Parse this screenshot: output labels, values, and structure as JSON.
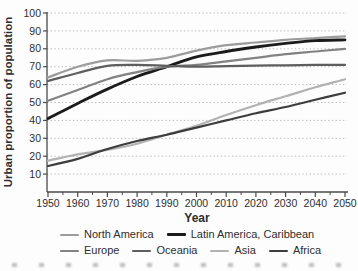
{
  "figure": {
    "background": "#fdfdfd"
  },
  "chart_data": {
    "type": "line",
    "title": "",
    "xlabel": "Year",
    "ylabel": "Urban proportion of population",
    "xlim": [
      1950,
      2050
    ],
    "ylim": [
      0,
      100
    ],
    "grid": "horizontal dotted at every 10 units",
    "legend_position": "below",
    "x": [
      1950,
      1960,
      1970,
      1980,
      1990,
      2000,
      2010,
      2020,
      2030,
      2040,
      2050
    ],
    "x_tick_labels": [
      "1950",
      "1960",
      "1970",
      "1980",
      "1990",
      "2000",
      "2010",
      "2020",
      "2030",
      "2040",
      "2050"
    ],
    "x_minor_ticks": [
      1955,
      1965,
      1975,
      1985,
      1995,
      2005,
      2015,
      2025,
      2035,
      2045
    ],
    "y_ticks": [
      10,
      20,
      30,
      40,
      50,
      60,
      70,
      80,
      90,
      100
    ],
    "y_tick_labels": [
      "10",
      "20",
      "30",
      "40",
      "50",
      "60",
      "70",
      "80",
      "90",
      "100"
    ],
    "series": [
      {
        "name": "North America",
        "color": "#9c9c9c",
        "width": 2.2,
        "values": [
          64,
          70,
          73.5,
          73.3,
          75,
          79,
          82,
          83.5,
          85,
          86,
          87
        ]
      },
      {
        "name": "Latin America, Caribbean",
        "color": "#1b1b1b",
        "width": 2.8,
        "values": [
          41,
          49.5,
          57.5,
          64.5,
          70,
          75.5,
          78.5,
          81,
          83,
          84.5,
          85
        ]
      },
      {
        "name": "Europe",
        "color": "#828282",
        "width": 2.2,
        "values": [
          51,
          57,
          63,
          67,
          70,
          71,
          73,
          75,
          77,
          78.5,
          80
        ]
      },
      {
        "name": "Oceania",
        "color": "#5e5e5e",
        "width": 2.2,
        "values": [
          62,
          66.5,
          70.5,
          71,
          70.5,
          70,
          70.3,
          70.6,
          70.8,
          71,
          71
        ]
      },
      {
        "name": "Asia",
        "color": "#b2b2b2",
        "width": 2.2,
        "values": [
          17.5,
          21,
          23.5,
          27,
          32,
          37,
          43,
          48.5,
          53.5,
          58.5,
          63
        ]
      },
      {
        "name": "Africa",
        "color": "#3d3d3d",
        "width": 2.2,
        "values": [
          14.5,
          18.5,
          24,
          28.5,
          32,
          36,
          40,
          44,
          47.5,
          51.5,
          55.5
        ]
      }
    ]
  },
  "legend": {
    "rows": [
      [
        0,
        1
      ],
      [
        2,
        3,
        4,
        5
      ]
    ]
  },
  "colors": {
    "axis": "#4a4a4a",
    "gridline": "#b8b8b8",
    "tick_text": "#2e2e2e"
  }
}
